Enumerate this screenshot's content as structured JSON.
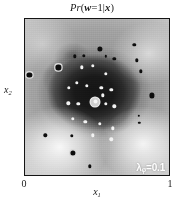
{
  "figure": {
    "title_prefix": "Pr",
    "title_open": "(",
    "title_var": "w",
    "title_eq": "=1|",
    "title_cond": "x",
    "title_close": ")",
    "title_full": "Pr(w=1|x)"
  },
  "axes": {
    "xlabel_base": "x",
    "xlabel_sub": "1",
    "ylabel_base": "x",
    "ylabel_sub": "2",
    "xticks": [
      "0",
      "1"
    ],
    "xtick_min": "0",
    "xtick_max": "1"
  },
  "annotation": {
    "lambda_symbol": "λ",
    "lambda_sub": "φ",
    "lambda_eq": "=0.1",
    "lambda_full": "λφ=0.1"
  },
  "chart_data": {
    "type": "heatmap",
    "title": "Pr(w=1|x)",
    "xlabel": "x1",
    "ylabel": "x2",
    "xlim": [
      0,
      1
    ],
    "ylim": [
      0,
      1
    ],
    "grid": false,
    "legend": "none",
    "colormap": "greyscale",
    "colormap_note": "dark = high Pr(w=1|x), light = low Pr(w=1|x)",
    "value_range": [
      0,
      1
    ],
    "annotations": [
      {
        "text": "λφ=0.1",
        "x": 0.88,
        "y": 0.06,
        "color": "#ffffff"
      }
    ],
    "density_peaks": [
      {
        "x": 0.48,
        "y": 0.53,
        "value": 0.97
      },
      {
        "x": 0.36,
        "y": 0.61,
        "value": 0.93
      },
      {
        "x": 0.6,
        "y": 0.58,
        "value": 0.94
      },
      {
        "x": 0.45,
        "y": 0.4,
        "value": 0.9
      },
      {
        "x": 0.62,
        "y": 0.38,
        "value": 0.82
      },
      {
        "x": 0.33,
        "y": 0.75,
        "value": 0.7
      }
    ],
    "density_lows": [
      {
        "x": 0.24,
        "y": 0.18,
        "value": 0.03
      },
      {
        "x": 0.82,
        "y": 0.2,
        "value": 0.04
      },
      {
        "x": 0.86,
        "y": 0.78,
        "value": 0.1
      },
      {
        "x": 0.12,
        "y": 0.84,
        "value": 0.14
      }
    ],
    "points": [
      {
        "x": 0.487,
        "y": 0.468,
        "class": 1,
        "size": "large",
        "marker": "center",
        "ring": true
      },
      {
        "x": 0.395,
        "y": 0.69,
        "class": 1,
        "size": "small"
      },
      {
        "x": 0.47,
        "y": 0.7,
        "class": 1,
        "size": "small"
      },
      {
        "x": 0.56,
        "y": 0.65,
        "class": 1,
        "size": "small"
      },
      {
        "x": 0.305,
        "y": 0.56,
        "class": 1,
        "size": "small"
      },
      {
        "x": 0.36,
        "y": 0.59,
        "class": 1,
        "size": "small"
      },
      {
        "x": 0.43,
        "y": 0.57,
        "class": 1,
        "size": "small"
      },
      {
        "x": 0.53,
        "y": 0.56,
        "class": 1,
        "size": "small"
      },
      {
        "x": 0.6,
        "y": 0.545,
        "class": 1,
        "size": "small"
      },
      {
        "x": 0.54,
        "y": 0.51,
        "class": 1,
        "size": "small"
      },
      {
        "x": 0.3,
        "y": 0.46,
        "class": 1,
        "size": "small"
      },
      {
        "x": 0.37,
        "y": 0.455,
        "class": 1,
        "size": "small"
      },
      {
        "x": 0.56,
        "y": 0.455,
        "class": 1,
        "size": "small"
      },
      {
        "x": 0.62,
        "y": 0.44,
        "class": 1,
        "size": "small"
      },
      {
        "x": 0.33,
        "y": 0.36,
        "class": 1,
        "size": "small"
      },
      {
        "x": 0.42,
        "y": 0.34,
        "class": 1,
        "size": "small"
      },
      {
        "x": 0.52,
        "y": 0.33,
        "class": 1,
        "size": "small"
      },
      {
        "x": 0.61,
        "y": 0.3,
        "class": 1,
        "size": "small"
      },
      {
        "x": 0.47,
        "y": 0.255,
        "class": 1,
        "size": "small"
      },
      {
        "x": 0.6,
        "y": 0.23,
        "class": 1,
        "size": "small"
      },
      {
        "x": 0.76,
        "y": 0.835,
        "class": 0,
        "size": "small"
      },
      {
        "x": 0.52,
        "y": 0.81,
        "class": 0,
        "size": "large"
      },
      {
        "x": 0.56,
        "y": 0.76,
        "class": 0,
        "size": "tiny"
      },
      {
        "x": 0.62,
        "y": 0.745,
        "class": 0,
        "size": "small"
      },
      {
        "x": 0.345,
        "y": 0.76,
        "class": 0,
        "size": "small"
      },
      {
        "x": 0.41,
        "y": 0.765,
        "class": 0,
        "size": "small"
      },
      {
        "x": 0.775,
        "y": 0.735,
        "class": 0,
        "size": "small"
      },
      {
        "x": 0.805,
        "y": 0.665,
        "class": 0,
        "size": "small"
      },
      {
        "x": 0.232,
        "y": 0.69,
        "class": 0,
        "size": "large",
        "ring": true
      },
      {
        "x": 0.03,
        "y": 0.64,
        "class": 0,
        "size": "large",
        "ring": true
      },
      {
        "x": 0.88,
        "y": 0.51,
        "class": 0,
        "size": "large"
      },
      {
        "x": 0.79,
        "y": 0.38,
        "class": 0,
        "size": "tiny"
      },
      {
        "x": 0.795,
        "y": 0.335,
        "class": 0,
        "size": "tiny"
      },
      {
        "x": 0.14,
        "y": 0.255,
        "class": 0,
        "size": "small"
      },
      {
        "x": 0.325,
        "y": 0.25,
        "class": 0,
        "size": "small"
      },
      {
        "x": 0.33,
        "y": 0.14,
        "class": 0,
        "size": "large",
        "ring": true
      },
      {
        "x": 0.45,
        "y": 0.055,
        "class": 0,
        "size": "small"
      }
    ]
  }
}
